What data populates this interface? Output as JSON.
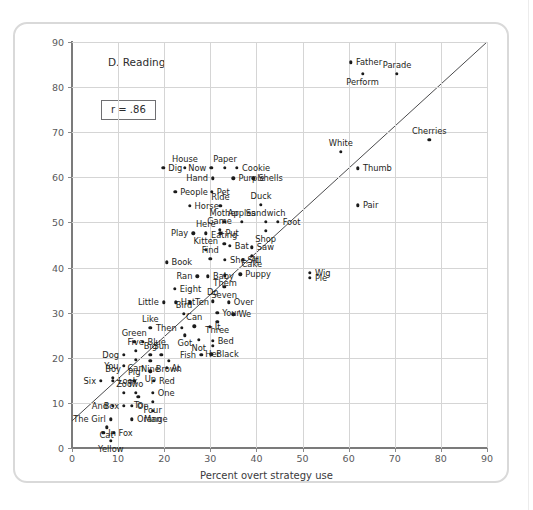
{
  "figure": {
    "panel_title": "D. Reading",
    "annotation_r": "r = .86",
    "correlation": 0.86
  },
  "chart_data": {
    "type": "scatter",
    "title": "D. Reading",
    "xlabel": "Percent overt strategy use",
    "ylabel": "Percent errors",
    "xlim": [
      0,
      90
    ],
    "ylim": [
      0,
      90
    ],
    "xticks": [
      0,
      10,
      20,
      30,
      40,
      50,
      60,
      70,
      80,
      90
    ],
    "yticks": [
      0,
      10,
      20,
      30,
      40,
      50,
      60,
      70,
      80,
      90
    ],
    "grid": true,
    "legend": "none",
    "annotations": [
      {
        "text": "D. Reading",
        "x": 13,
        "y": 85
      },
      {
        "text": "r = .86",
        "x": 7,
        "y": 76
      }
    ],
    "fit_line": {
      "type": "regression",
      "x0": 0,
      "y0": 6.0,
      "x1": 90,
      "y1": 90.0
    },
    "point_label_field": "label",
    "points": [
      {
        "label": "Father",
        "x": 60.5,
        "y": 85.5,
        "pos": "r"
      },
      {
        "label": "Perform",
        "x": 63.0,
        "y": 83.0,
        "pos": "b"
      },
      {
        "label": "Parade",
        "x": 70.5,
        "y": 83.0,
        "pos": "t"
      },
      {
        "label": "Cherries",
        "x": 77.5,
        "y": 68.3,
        "pos": "t"
      },
      {
        "label": "White",
        "x": 58.3,
        "y": 65.6,
        "pos": "t"
      },
      {
        "label": "Thumb",
        "x": 62.0,
        "y": 62.0,
        "pos": "r"
      },
      {
        "label": "Pair",
        "x": 62.0,
        "y": 53.8,
        "pos": "r"
      },
      {
        "label": "Dig",
        "x": 19.8,
        "y": 62.1,
        "pos": "r"
      },
      {
        "label": "House",
        "x": 24.5,
        "y": 62.1,
        "pos": "t"
      },
      {
        "label": "Now",
        "x": 30.2,
        "y": 62.1,
        "pos": "l"
      },
      {
        "label": "Paper",
        "x": 33.2,
        "y": 62.1,
        "pos": "t"
      },
      {
        "label": "Cookie",
        "x": 35.8,
        "y": 62.1,
        "pos": "r"
      },
      {
        "label": "Hand",
        "x": 30.6,
        "y": 59.8,
        "pos": "l"
      },
      {
        "label": "Purple",
        "x": 35.0,
        "y": 59.8,
        "pos": "r"
      },
      {
        "label": "Shells",
        "x": 39.3,
        "y": 59.8,
        "pos": "r"
      },
      {
        "label": "People",
        "x": 22.4,
        "y": 56.8,
        "pos": "r"
      },
      {
        "label": "Pet",
        "x": 30.3,
        "y": 56.8,
        "pos": "r"
      },
      {
        "label": "Horse",
        "x": 25.5,
        "y": 53.7,
        "pos": "r"
      },
      {
        "label": "Ride",
        "x": 32.2,
        "y": 53.7,
        "pos": "t"
      },
      {
        "label": "Duck",
        "x": 41.0,
        "y": 53.9,
        "pos": "t"
      },
      {
        "label": "Mother",
        "x": 33.0,
        "y": 50.2,
        "pos": "t"
      },
      {
        "label": "Apples",
        "x": 36.8,
        "y": 50.2,
        "pos": "t"
      },
      {
        "label": "Sandwich",
        "x": 42.0,
        "y": 50.2,
        "pos": "t"
      },
      {
        "label": "Foot",
        "x": 44.6,
        "y": 50.2,
        "pos": "r"
      },
      {
        "label": "Shop",
        "x": 42.0,
        "y": 48.2,
        "pos": "b"
      },
      {
        "label": "Here",
        "x": 29.0,
        "y": 47.6,
        "pos": "t"
      },
      {
        "label": "Game",
        "x": 32.0,
        "y": 48.4,
        "pos": "t"
      },
      {
        "label": "Play",
        "x": 26.3,
        "y": 47.6,
        "pos": "l"
      },
      {
        "label": "Put",
        "x": 32.2,
        "y": 47.6,
        "pos": "r"
      },
      {
        "label": "Eating",
        "x": 33.0,
        "y": 45.3,
        "pos": "t"
      },
      {
        "label": "Bat",
        "x": 34.2,
        "y": 44.8,
        "pos": "r"
      },
      {
        "label": "Saw",
        "x": 39.0,
        "y": 44.5,
        "pos": "r"
      },
      {
        "label": "Kitten",
        "x": 29.0,
        "y": 44.0,
        "pos": "t"
      },
      {
        "label": "Cake",
        "x": 39.0,
        "y": 42.6,
        "pos": "b"
      },
      {
        "label": "Find",
        "x": 30.0,
        "y": 42.0,
        "pos": "t"
      },
      {
        "label": "She, All",
        "x": 33.2,
        "y": 41.7,
        "pos": "r"
      },
      {
        "label": "Sit",
        "x": 37.0,
        "y": 41.7,
        "pos": "r"
      },
      {
        "label": "Book",
        "x": 20.5,
        "y": 41.2,
        "pos": "r"
      },
      {
        "label": "Wig",
        "x": 51.6,
        "y": 38.9,
        "pos": "r"
      },
      {
        "label": "Pie",
        "x": 51.6,
        "y": 37.7,
        "pos": "r"
      },
      {
        "label": "Ran",
        "x": 27.2,
        "y": 38.1,
        "pos": "l"
      },
      {
        "label": "Baby",
        "x": 29.5,
        "y": 38.1,
        "pos": "r"
      },
      {
        "label": "Them",
        "x": 33.2,
        "y": 38.3,
        "pos": "b"
      },
      {
        "label": "Puppy",
        "x": 36.5,
        "y": 38.5,
        "pos": "r"
      },
      {
        "label": "Seven",
        "x": 33.0,
        "y": 35.8,
        "pos": "b"
      },
      {
        "label": "Eight",
        "x": 22.3,
        "y": 35.3,
        "pos": "r"
      },
      {
        "label": "Little",
        "x": 19.9,
        "y": 32.3,
        "pos": "l"
      },
      {
        "label": "Hat",
        "x": 22.5,
        "y": 32.3,
        "pos": "r"
      },
      {
        "label": "Ten",
        "x": 25.6,
        "y": 32.3,
        "pos": "r"
      },
      {
        "label": "Do",
        "x": 30.5,
        "y": 32.5,
        "pos": "t"
      },
      {
        "label": "Over",
        "x": 34.0,
        "y": 32.3,
        "pos": "r"
      },
      {
        "label": "Bird",
        "x": 24.3,
        "y": 29.8,
        "pos": "t"
      },
      {
        "label": "Your",
        "x": 31.5,
        "y": 30.0,
        "pos": "r"
      },
      {
        "label": "We",
        "x": 35.0,
        "y": 29.6,
        "pos": "r"
      },
      {
        "label": "Three",
        "x": 31.5,
        "y": 28.0,
        "pos": "b"
      },
      {
        "label": "Like",
        "x": 17.0,
        "y": 26.7,
        "pos": "t"
      },
      {
        "label": "Then",
        "x": 23.8,
        "y": 26.7,
        "pos": "l"
      },
      {
        "label": "Can",
        "x": 26.5,
        "y": 27.0,
        "pos": "t"
      },
      {
        "label": "It",
        "x": 29.9,
        "y": 26.9,
        "pos": "r"
      },
      {
        "label": "Got",
        "x": 24.5,
        "y": 25.0,
        "pos": "b"
      },
      {
        "label": "Not",
        "x": 27.5,
        "y": 24.0,
        "pos": "b"
      },
      {
        "label": "Bed",
        "x": 30.5,
        "y": 23.8,
        "pos": "r"
      },
      {
        "label": "Green",
        "x": 13.5,
        "y": 23.5,
        "pos": "t"
      },
      {
        "label": "Blue",
        "x": 15.3,
        "y": 23.6,
        "pos": "r"
      },
      {
        "label": "Her",
        "x": 30.5,
        "y": 22.7,
        "pos": "b"
      },
      {
        "label": "Dog",
        "x": 11.3,
        "y": 20.6,
        "pos": "l"
      },
      {
        "label": "Five",
        "x": 13.8,
        "y": 21.5,
        "pos": "t"
      },
      {
        "label": "Big",
        "x": 17.0,
        "y": 20.7,
        "pos": "t"
      },
      {
        "label": "Sun",
        "x": 19.4,
        "y": 20.7,
        "pos": "t"
      },
      {
        "label": "Fish",
        "x": 28.0,
        "y": 20.7,
        "pos": "l"
      },
      {
        "label": "Black",
        "x": 30.2,
        "y": 20.8,
        "pos": "r"
      },
      {
        "label": "Nine",
        "x": 17.0,
        "y": 19.3,
        "pos": "b"
      },
      {
        "label": "Can2",
        "x": 13.8,
        "y": 19.6,
        "pos": "b"
      },
      {
        "label": "You",
        "x": 11.2,
        "y": 18.2,
        "pos": "l"
      },
      {
        "label": "Brown",
        "x": 21.0,
        "y": 19.3,
        "pos": "b"
      },
      {
        "label": "Up",
        "x": 17.0,
        "y": 17.0,
        "pos": "b"
      },
      {
        "label": "At",
        "x": 20.5,
        "y": 17.8,
        "pos": "r"
      },
      {
        "label": "Six",
        "x": 6.3,
        "y": 14.9,
        "pos": "l"
      },
      {
        "label": "Boy",
        "x": 8.9,
        "y": 15.5,
        "pos": "t"
      },
      {
        "label": "Look",
        "x": 8.9,
        "y": 14.9,
        "pos": "r"
      },
      {
        "label": "Pig",
        "x": 13.5,
        "y": 14.9,
        "pos": "t"
      },
      {
        "label": "Red",
        "x": 17.8,
        "y": 14.9,
        "pos": "r"
      },
      {
        "label": "Zoo",
        "x": 11.3,
        "y": 12.2,
        "pos": "t"
      },
      {
        "label": "Two",
        "x": 13.8,
        "y": 12.2,
        "pos": "t"
      },
      {
        "label": "To",
        "x": 14.4,
        "y": 11.3,
        "pos": "b"
      },
      {
        "label": "One",
        "x": 17.5,
        "y": 12.2,
        "pos": "r"
      },
      {
        "label": "And",
        "x": 8.9,
        "y": 9.4,
        "pos": "l"
      },
      {
        "label": "Box",
        "x": 11.3,
        "y": 9.4,
        "pos": "l"
      },
      {
        "label": "On",
        "x": 13.0,
        "y": 9.4,
        "pos": "r"
      },
      {
        "label": "Four",
        "x": 17.5,
        "y": 10.2,
        "pos": "b"
      },
      {
        "label": "Man",
        "x": 17.5,
        "y": 8.2,
        "pos": "b"
      },
      {
        "label": "The Girl",
        "x": 8.4,
        "y": 6.4,
        "pos": "l"
      },
      {
        "label": "Orange",
        "x": 13.0,
        "y": 6.4,
        "pos": "r"
      },
      {
        "label": "Cat",
        "x": 7.5,
        "y": 4.6,
        "pos": "b"
      },
      {
        "label": "In",
        "x": 6.8,
        "y": 3.4,
        "pos": "r"
      },
      {
        "label": "Fox",
        "x": 9.0,
        "y": 3.4,
        "pos": "r"
      },
      {
        "label": "Yellow",
        "x": 8.4,
        "y": 1.6,
        "pos": "b"
      }
    ]
  }
}
